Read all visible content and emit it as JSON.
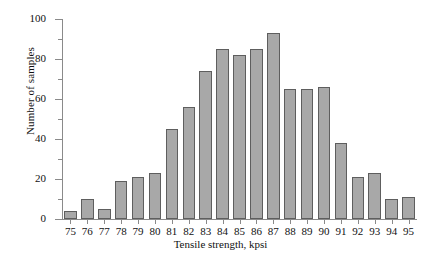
{
  "chart_data": {
    "type": "bar",
    "title": "",
    "xlabel": "Tensile strength, kpsi",
    "ylabel": "Number of samples",
    "categories": [
      "75",
      "76",
      "77",
      "78",
      "79",
      "80",
      "81",
      "82",
      "83",
      "84",
      "85",
      "86",
      "87",
      "88",
      "89",
      "90",
      "91",
      "92",
      "93",
      "94",
      "95"
    ],
    "values": [
      4,
      10,
      5,
      19,
      21,
      23,
      45,
      56,
      74,
      85,
      82,
      85,
      93,
      65,
      65,
      66,
      38,
      21,
      23,
      10,
      11
    ],
    "ylim": [
      0,
      100
    ],
    "yticks": [
      0,
      20,
      40,
      60,
      80,
      100
    ],
    "ytick_labels": [
      "0",
      "20",
      "40",
      "60",
      "80",
      "100"
    ],
    "yminor_ticks": [
      10,
      30,
      50,
      70,
      90
    ],
    "grid": false,
    "legend": null,
    "bar_fill_color": "#a8a8a8",
    "bar_edge_color": "#5e5e5e",
    "axis_color": "#8a8a8a",
    "background_color": "#ffffff"
  }
}
